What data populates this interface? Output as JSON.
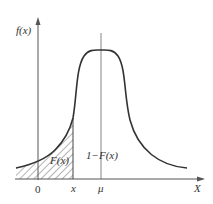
{
  "diagram": {
    "type": "probability-density-curve",
    "labels": {
      "y_axis": "f(x)",
      "x_axis": "X",
      "origin": "0",
      "x_mark": "x",
      "mean_mark": "μ",
      "cdf_area": "F(x)",
      "tail_area": "1−F(x)"
    },
    "colors": {
      "stroke": "#333333",
      "axis": "#555555",
      "background": "#ffffff"
    }
  }
}
